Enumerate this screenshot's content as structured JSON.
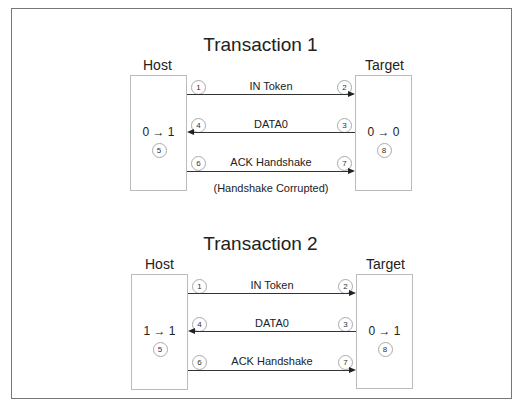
{
  "transactions": [
    {
      "title": "Transaction 1",
      "host": {
        "label": "Host",
        "state": "0 → 1",
        "step": "5"
      },
      "target": {
        "label": "Target",
        "state": "0 → 0",
        "step": "8"
      },
      "messages": [
        {
          "label": "IN Token",
          "direction": "host-to-target",
          "from_step": "1",
          "to_step": "2"
        },
        {
          "label": "DATA0",
          "direction": "target-to-host",
          "from_step": "3",
          "to_step": "4"
        },
        {
          "label": "ACK Handshake",
          "direction": "host-to-target",
          "from_step": "6",
          "to_step": "7"
        }
      ],
      "note": "(Handshake Corrupted)"
    },
    {
      "title": "Transaction 2",
      "host": {
        "label": "Host",
        "state": "1 → 1",
        "step": "5"
      },
      "target": {
        "label": "Target",
        "state": "0 → 1",
        "step": "8"
      },
      "messages": [
        {
          "label": "IN Token",
          "direction": "host-to-target",
          "from_step": "1",
          "to_step": "2"
        },
        {
          "label": "DATA0",
          "direction": "target-to-host",
          "from_step": "3",
          "to_step": "4"
        },
        {
          "label": "ACK Handshake",
          "direction": "host-to-target",
          "from_step": "6",
          "to_step": "7"
        }
      ]
    }
  ]
}
